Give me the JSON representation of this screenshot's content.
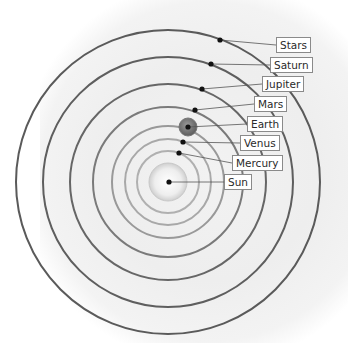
{
  "diagram": {
    "center": {
      "x": 168,
      "y": 182
    },
    "rings": [
      {
        "name": "stars-orbit",
        "r": 152,
        "color": "#5a5a5a",
        "width": 2
      },
      {
        "name": "saturn-orbit",
        "r": 125,
        "color": "#5e5e5e",
        "width": 2
      },
      {
        "name": "jupiter-orbit",
        "r": 98,
        "color": "#666666",
        "width": 2
      },
      {
        "name": "mars-orbit",
        "r": 75,
        "color": "#7a7a7a",
        "width": 2
      },
      {
        "name": "earth-orbit",
        "r": 56,
        "color": "#999999",
        "width": 2
      },
      {
        "name": "venus-orbit",
        "r": 43,
        "color": "#a8a8a8",
        "width": 2
      },
      {
        "name": "mercury-orbit",
        "r": 31,
        "color": "#b0b0b0",
        "width": 2
      }
    ],
    "sun_disc": {
      "r": 19
    },
    "bodies": [
      {
        "label": "Stars",
        "dot": [
          220,
          40
        ],
        "box": [
          276,
          37
        ]
      },
      {
        "label": "Saturn",
        "dot": [
          211,
          64
        ],
        "box": [
          270,
          57
        ]
      },
      {
        "label": "Jupiter",
        "dot": [
          202,
          89
        ],
        "box": [
          262,
          76
        ]
      },
      {
        "label": "Mars",
        "dot": [
          195,
          110
        ],
        "box": [
          254,
          96
        ]
      },
      {
        "label": "Earth",
        "dot": [
          188,
          127
        ],
        "box": [
          247,
          116
        ]
      },
      {
        "label": "Venus",
        "dot": [
          183,
          142
        ],
        "box": [
          240,
          135
        ]
      },
      {
        "label": "Mercury",
        "dot": [
          179,
          153
        ],
        "box": [
          232,
          155
        ]
      },
      {
        "label": "Sun",
        "dot": [
          169,
          182
        ],
        "box": [
          224,
          174
        ]
      }
    ]
  },
  "labels": {
    "stars": "Stars",
    "saturn": "Saturn",
    "jupiter": "Jupiter",
    "mars": "Mars",
    "earth": "Earth",
    "venus": "Venus",
    "mercury": "Mercury",
    "sun": "Sun"
  }
}
